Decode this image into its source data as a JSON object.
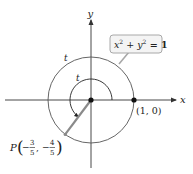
{
  "diagram": {
    "axes": {
      "x_label": "x",
      "y_label": "y"
    },
    "circle": {
      "equation_lhs_x": "x",
      "equation_sup_x": "2",
      "equation_plus": " + ",
      "equation_lhs_y": "y",
      "equation_sup_y": "2",
      "equation_rhs": " = 1",
      "radius": 1
    },
    "arc_labels": {
      "outer": "t",
      "inner": "t"
    },
    "point_start": {
      "label": "(1, 0)",
      "x": 1,
      "y": 0
    },
    "point_P": {
      "name": "P",
      "x_num": "3",
      "x_den": "5",
      "y_num": "4",
      "y_den": "5",
      "x": -0.6,
      "y": -0.8,
      "minus": "−",
      "comma": ","
    },
    "colors": {
      "axis": "#333333",
      "circle": "#555555",
      "radius_segment": "#8a8a8a",
      "callout_border": "#a8a8a8",
      "callout_fill": "#f4f4f4",
      "point": "#111111"
    }
  }
}
